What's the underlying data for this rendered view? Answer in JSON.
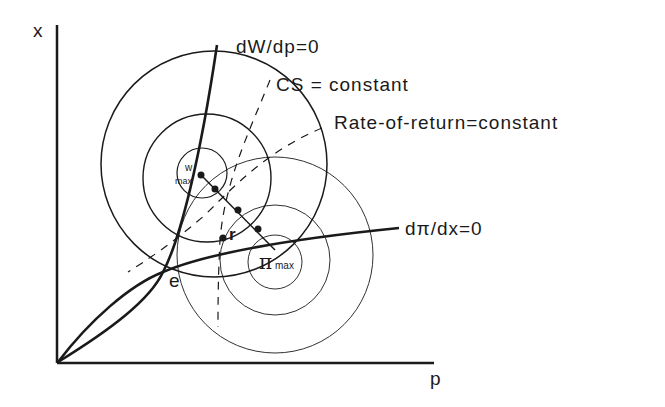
{
  "axes": {
    "y_label": "x",
    "x_label": "p"
  },
  "curves": {
    "welfare_foc": "dW/dp=0",
    "profit_foc": "dπ/dx=0",
    "consumer_surplus": "CS = constant",
    "rate_of_return": "Rate-of-return=constant"
  },
  "points": {
    "welfare_max_top": "w",
    "welfare_max_bottom": "max",
    "profit_max_symbol": "π",
    "profit_max_sub": "max",
    "regulated": "r",
    "equilibrium": "e"
  },
  "colors": {
    "ink": "#1a1a1a",
    "background": "#ffffff"
  }
}
